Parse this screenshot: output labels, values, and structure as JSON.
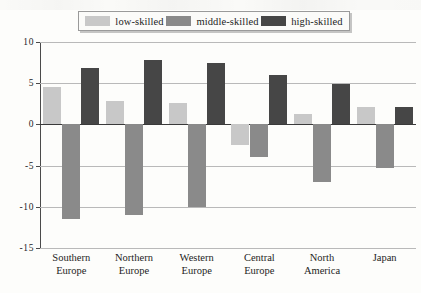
{
  "legend": {
    "items": [
      {
        "label": "low-skilled",
        "color": "#c8c8c8",
        "icon": "legend-swatch-icon"
      },
      {
        "label": "middle-skilled",
        "color": "#8a8a8a",
        "icon": "legend-swatch-icon"
      },
      {
        "label": "high-skilled",
        "color": "#464646",
        "icon": "legend-swatch-icon"
      }
    ]
  },
  "axis": {
    "y_ticks": [
      "10",
      "5",
      "0",
      "-5",
      "-10",
      "-15"
    ]
  },
  "chart_data": {
    "type": "bar",
    "title": "",
    "xlabel": "",
    "ylabel": "",
    "ylim": [
      -15,
      10
    ],
    "ytick_values": [
      10,
      5,
      0,
      -5,
      -10,
      -15
    ],
    "grid": true,
    "legend_position": "top",
    "orientation": "vertical",
    "grouped": true,
    "zero_baseline": true,
    "categories": [
      "Southern Europe",
      "Northern Europe",
      "Western Europe",
      "Central Europe",
      "North America",
      "Japan"
    ],
    "category_lines": [
      [
        "Southern",
        "Europe"
      ],
      [
        "Northern",
        "Europe"
      ],
      [
        "Western",
        "Europe"
      ],
      [
        "Central",
        "Europe"
      ],
      [
        "North",
        "America"
      ],
      [
        "Japan"
      ]
    ],
    "series": [
      {
        "name": "low-skilled",
        "color": "#c8c8c8",
        "values": [
          4.5,
          2.8,
          2.6,
          -2.5,
          1.3,
          2.1
        ]
      },
      {
        "name": "middle-skilled",
        "color": "#8a8a8a",
        "values": [
          -11.5,
          -11.0,
          -10.0,
          -4.0,
          -7.0,
          -5.3
        ]
      },
      {
        "name": "high-skilled",
        "color": "#464646",
        "values": [
          6.8,
          7.8,
          7.4,
          6.0,
          4.9,
          2.1
        ]
      }
    ]
  }
}
